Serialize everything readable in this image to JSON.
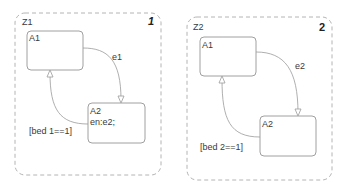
{
  "charts": [
    {
      "name": "Z1",
      "number": "1",
      "states": [
        {
          "name": "A1",
          "action": ""
        },
        {
          "name": "A2",
          "action": "en:e2;"
        }
      ],
      "transitions": [
        {
          "from": "A1",
          "to": "A2",
          "label": "e1"
        },
        {
          "from": "A2",
          "to": "A1",
          "label": "[bed 1==1]"
        }
      ]
    },
    {
      "name": "Z2",
      "number": "2",
      "states": [
        {
          "name": "A1",
          "action": ""
        },
        {
          "name": "A2",
          "action": ""
        }
      ],
      "transitions": [
        {
          "from": "A1",
          "to": "A2",
          "label": "e2"
        },
        {
          "from": "A2",
          "to": "A1",
          "label": "[bed 2==1]"
        }
      ]
    }
  ],
  "colors": {
    "state_border": "#a0a0a0",
    "dashed_border": "#b0b0b0",
    "transition": "#9a9a9a"
  }
}
